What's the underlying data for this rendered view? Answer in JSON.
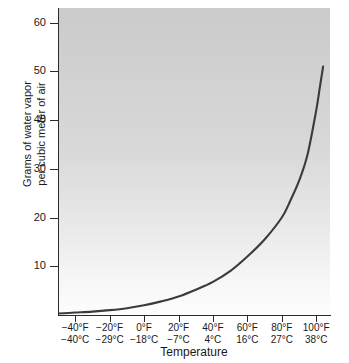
{
  "chart_data": {
    "type": "line",
    "title": "",
    "subtitle": "",
    "xlabel": "Temperature",
    "ylabel_line1": "Grams of water vapor",
    "ylabel_line2": "per cubic meter of air",
    "ylabel": "Grams of water vapor per cubic meter of air",
    "grid": false,
    "legend": "none",
    "ylim": [
      0,
      63
    ],
    "xlim_f": [
      -50,
      108
    ],
    "y_ticks": [
      60,
      50,
      40,
      30,
      20,
      10
    ],
    "x_ticks": [
      {
        "f": "−40°F",
        "c": "−40°C",
        "f_val": -40,
        "c_val": -40
      },
      {
        "f": "−20°F",
        "c": "−29°C",
        "f_val": -20,
        "c_val": -29
      },
      {
        "f": "0°F",
        "c": "−18°C",
        "f_val": 0,
        "c_val": -18
      },
      {
        "f": "20°F",
        "c": "−7°C",
        "f_val": 20,
        "c_val": -7
      },
      {
        "f": "40°F",
        "c": "4°C",
        "f_val": 40,
        "c_val": 4
      },
      {
        "f": "60°F",
        "c": "16°C",
        "f_val": 60,
        "c_val": 16
      },
      {
        "f": "80°F",
        "c": "27°C",
        "f_val": 80,
        "c_val": 27
      },
      {
        "f": "100°F",
        "c": "38°C",
        "f_val": 100,
        "c_val": 38
      }
    ],
    "series": [
      {
        "name": "Saturation water vapor capacity",
        "x_f": [
          -50,
          -40,
          -30,
          -20,
          -10,
          0,
          10,
          20,
          30,
          40,
          50,
          60,
          70,
          80,
          85,
          90,
          95,
          100,
          102,
          104
        ],
        "values": [
          0.3,
          0.5,
          0.7,
          1.0,
          1.4,
          2.0,
          2.8,
          3.8,
          5.2,
          6.8,
          9.0,
          12.0,
          15.5,
          20.0,
          23.5,
          27.5,
          33.0,
          42.0,
          46.5,
          51.0
        ]
      }
    ],
    "curve_color": "#3b3b3b",
    "plot_bg_top": "#cbcbcb",
    "plot_bg_bottom": "#fdfdfd",
    "axis_color": "#2b2b2b"
  }
}
